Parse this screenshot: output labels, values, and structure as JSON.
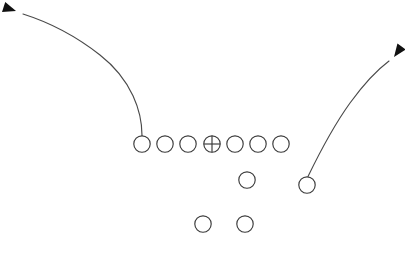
{
  "diagram": {
    "canvas": {
      "width": 405,
      "height": 257,
      "background": "#ffffff"
    },
    "style": {
      "circle_stroke": "#3a3a3a",
      "route_stroke": "#4a4a4a",
      "arrow_fill": "#111111",
      "stroke_width": 1.15,
      "circle_radius": 8.2
    },
    "players": [
      {
        "label": "left-end",
        "role": "line",
        "x": 142,
        "y": 144,
        "marker": "circle"
      },
      {
        "label": "left-tackle",
        "role": "line",
        "x": 165,
        "y": 144,
        "marker": "circle"
      },
      {
        "label": "left-guard",
        "role": "line",
        "x": 188,
        "y": 144,
        "marker": "circle"
      },
      {
        "label": "center",
        "role": "line",
        "x": 212,
        "y": 144,
        "marker": "circle-cross"
      },
      {
        "label": "right-guard",
        "role": "line",
        "x": 235,
        "y": 144,
        "marker": "circle"
      },
      {
        "label": "right-tackle",
        "role": "line",
        "x": 258,
        "y": 144,
        "marker": "circle"
      },
      {
        "label": "right-end",
        "role": "line",
        "x": 281,
        "y": 144,
        "marker": "circle"
      },
      {
        "label": "quarterback",
        "role": "backfield",
        "x": 247,
        "y": 180,
        "marker": "circle"
      },
      {
        "label": "flanker",
        "role": "backfield",
        "x": 307,
        "y": 185,
        "marker": "circle"
      },
      {
        "label": "left-back",
        "role": "backfield",
        "x": 203,
        "y": 224,
        "marker": "circle"
      },
      {
        "label": "right-back",
        "role": "backfield",
        "x": 245,
        "y": 224,
        "marker": "circle"
      }
    ],
    "routes": [
      {
        "label": "left-end-route",
        "from": "left-end",
        "path": "M 142 135.5 C 142 112, 132 80, 100 55 C 72 33, 42 20, 23 14",
        "arrow": {
          "tip_x": 16,
          "tip_y": 11,
          "angle_deg": 198
        }
      },
      {
        "label": "flanker-route",
        "from": "flanker",
        "path": "M 308 176.5 C 316 160, 332 128, 350 103 C 366 81, 381 67, 389 61",
        "arrow": {
          "tip_x": 394,
          "tip_y": 57,
          "angle_deg": -54
        }
      }
    ]
  }
}
